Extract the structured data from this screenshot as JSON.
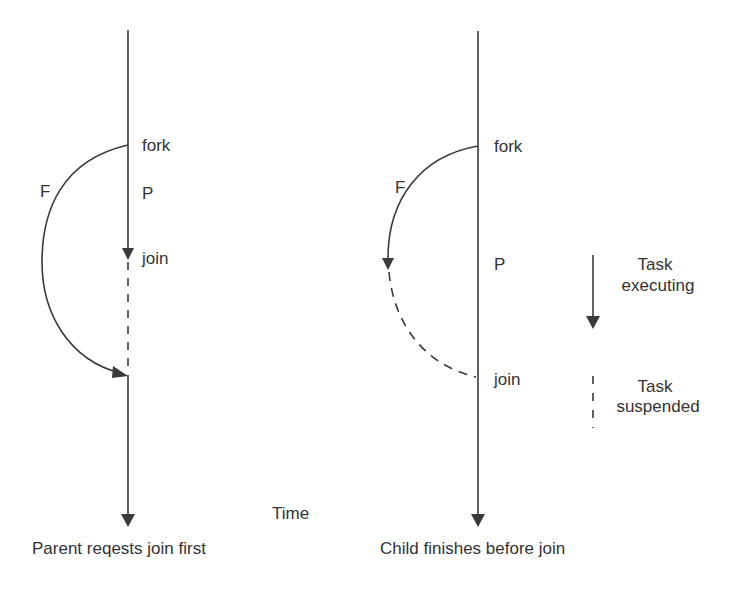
{
  "colors": {
    "stroke": "#3a3a3a",
    "text": "#333333",
    "background": "#ffffff"
  },
  "left_panel": {
    "caption": "Parent reqests join first",
    "fork_label": "fork",
    "parent_label": "P",
    "child_label": "F",
    "join_label": "join"
  },
  "right_panel": {
    "caption": "Child finishes before join",
    "fork_label": "fork",
    "parent_label": "P",
    "child_label": "F",
    "join_label": "join"
  },
  "axis_label": "Time",
  "legend": {
    "executing": {
      "line1": "Task",
      "line2": "executing",
      "style": "solid-arrow"
    },
    "suspended": {
      "line1": "Task",
      "line2": "suspended",
      "style": "dashed"
    }
  }
}
